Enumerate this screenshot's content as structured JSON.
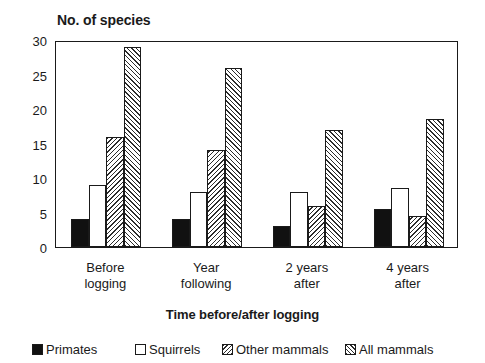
{
  "chart_data": {
    "type": "bar",
    "title": "No. of species",
    "xlabel": "Time before/after logging",
    "ylabel": "",
    "ylim": [
      0,
      30
    ],
    "yticks": [
      0,
      5,
      10,
      15,
      20,
      25,
      30
    ],
    "ytick_labels": [
      "0",
      "5",
      "10",
      "15",
      "20",
      "25",
      "30"
    ],
    "grid": false,
    "legend_position": "bottom",
    "categories": [
      "Before\nlogging",
      "Year\nfollowing",
      "2 years\nafter",
      "4 years\nafter"
    ],
    "series": [
      {
        "name": "Primates",
        "values": [
          4,
          4,
          3,
          5.5
        ],
        "fill": "solid-black",
        "color": "#111111"
      },
      {
        "name": "Squirrels",
        "values": [
          9,
          8,
          8,
          8.5
        ],
        "fill": "open-white",
        "color": "#ffffff"
      },
      {
        "name": "Other mammals",
        "values": [
          16,
          14,
          6,
          4.5
        ],
        "fill": "hatch-back",
        "color": "#2b2b2b"
      },
      {
        "name": "All mammals",
        "values": [
          29,
          26,
          17,
          18.5
        ],
        "fill": "hatch-forward",
        "color": "#2b2b2b"
      }
    ]
  },
  "legend": {
    "items": [
      {
        "label": "Primates"
      },
      {
        "label": "Squirrels"
      },
      {
        "label": "Other mammals"
      },
      {
        "label": "All mammals"
      }
    ]
  }
}
